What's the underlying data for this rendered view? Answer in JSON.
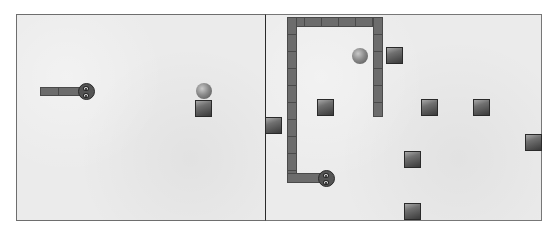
{
  "game": {
    "panels": [
      {
        "id": "left",
        "snake": {
          "direction": "right",
          "body_length_cells": 2
        },
        "items": [
          {
            "type": "ball"
          },
          {
            "type": "block"
          }
        ]
      },
      {
        "id": "right",
        "snake": {
          "direction": "right",
          "shape": "long hooked body"
        },
        "items": [
          {
            "type": "ball"
          },
          {
            "type": "block",
            "count": 8
          }
        ]
      }
    ],
    "colors": {
      "background": "#ebebeb",
      "border": "#6e6e6e",
      "snake_body": "#6c6c6c",
      "block": "#505050",
      "ball": "#8a8a8a"
    }
  }
}
